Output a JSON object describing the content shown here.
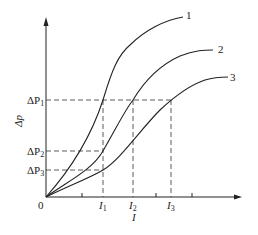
{
  "diagram": {
    "type": "curve-plot",
    "x_axis": {
      "label": "I",
      "origin_label": "0",
      "ticks": [
        "I1",
        "I2",
        "I3"
      ]
    },
    "y_axis": {
      "label": "Δp",
      "ticks": [
        "ΔP1",
        "ΔP2",
        "ΔP3"
      ]
    },
    "curves": [
      {
        "id": "1",
        "label": "1"
      },
      {
        "id": "2",
        "label": "2"
      },
      {
        "id": "3",
        "label": "3"
      }
    ],
    "labels": {
      "origin": "0",
      "x_axis": "I",
      "y_axis": "Δp",
      "dp1": "ΔP",
      "dp1_sub": "1",
      "dp2": "ΔP",
      "dp2_sub": "2",
      "dp3": "ΔP",
      "dp3_sub": "3",
      "i1": "I",
      "i1_sub": "1",
      "i2": "I",
      "i2_sub": "2",
      "i3": "I",
      "i3_sub": "3",
      "curve1": "1",
      "curve2": "2",
      "curve3": "3"
    },
    "colors": {
      "line": "#222222",
      "background": "#ffffff"
    }
  }
}
